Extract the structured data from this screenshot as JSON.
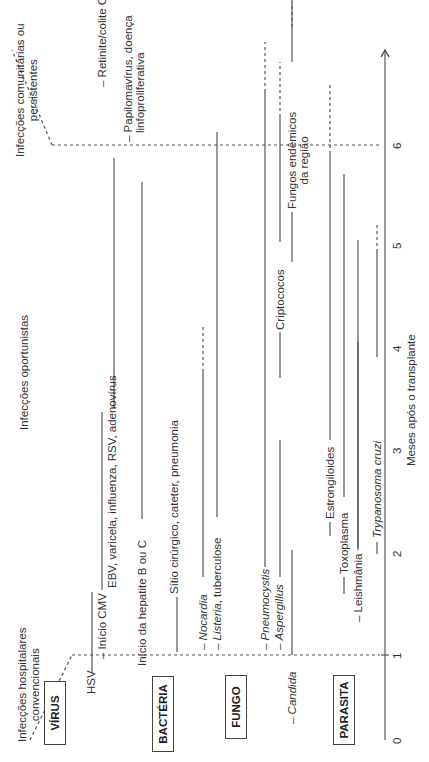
{
  "phases": {
    "early": "Infecções hospitalares convencionais",
    "early_line2": "convencionais",
    "early_line1": "Infecções hospitalares",
    "mid": "Infecções oportunistas",
    "late_line1": "Infecções comunitárias ou",
    "late_line2": "persistentes"
  },
  "categories": {
    "virus": "VÍRUS",
    "bacteria": "BACTÉRIA",
    "fungus": "FUNGO",
    "parasite": "PARASITA"
  },
  "labels": {
    "hsv": "HSV",
    "cmv_onset": "– Início CMV",
    "ebv": "EBV, varicela, influenza, RSV, adenovírus",
    "retinitis": "– Retinite/colite CMV",
    "hep_onset": "Início da hepatite B ou C",
    "papilloma_1": "– Papilomavírus, doença",
    "papilloma_2": "linfoproliferativa",
    "surgical": "Sítio cirúrgico, cateter, pneumonia",
    "nocardia": "Nocardia",
    "listeria": "Listeria",
    "listeria_rest": ", tuberculose",
    "pneumocystis": "Pneumocystis",
    "aspergillus": "Aspergillus",
    "candida": "Candida",
    "cryptococcus": "Criptococos",
    "endemic_1": "Fungos endêmicos",
    "endemic_2": "da região",
    "strongyloides": "Estrongiloides",
    "toxoplasma": "Toxoplasma",
    "leishmania": "– Leishmânia",
    "trypanosoma": "Trypanosoma cruzi",
    "dash": "– "
  },
  "axis": {
    "ticks": [
      "0",
      "1",
      "2",
      "3",
      "4",
      "5",
      "6"
    ],
    "label": "Meses após o transplante"
  },
  "timeline": {
    "unit": "months",
    "range": [
      0,
      6
    ],
    "bars": [
      {
        "name": "HSV",
        "start": 0.7,
        "end": 1.5
      },
      {
        "name": "Início CMV",
        "start": 1.6,
        "end": 3.4
      },
      {
        "name": "EBV, varicela, influenza, RSV, adenovírus",
        "start": 3.5,
        "end": 5.8
      },
      {
        "name": "Retinite/colite CMV",
        "start": 6.2,
        "end": 6.8
      },
      {
        "name": "Início da hepatite B ou C",
        "start": 2.3,
        "end": 5.7
      },
      {
        "name": "Papilomavírus, doença linfoproliferativa",
        "start": 7.0,
        "end": 7.4
      },
      {
        "name": "Sítio cirúrgico",
        "start": 0.7,
        "end": 1.3
      },
      {
        "name": "Nocardia",
        "start": 1.7,
        "end": 3.7,
        "dashed_to": 4.5
      },
      {
        "name": "Listeria, tuberculose",
        "start": 2.3,
        "end": 6.0
      },
      {
        "name": "Pneumocystis",
        "start": 1.9,
        "end": 6.0,
        "dashed_to": 6.8
      },
      {
        "name": "Aspergillus",
        "start": 1.8,
        "end": 3.2
      },
      {
        "name": "Candida",
        "start": 1.0,
        "end": 2.3
      },
      {
        "name": "Criptococos",
        "start": 3.6,
        "end": 3.9
      },
      {
        "name": "Fungos endêmicos",
        "start": 4.6,
        "end": 6.7,
        "dashed_to": 7.3
      },
      {
        "name": "Estrongiloides",
        "start": 2.8,
        "end": 5.9,
        "dashed_to": 6.8
      },
      {
        "name": "Toxoplasma",
        "start": 2.5,
        "end": 5.9
      },
      {
        "name": "Leishmânia",
        "start": 1.9,
        "end": 4.8
      },
      {
        "name": "Trypanosoma cruzi",
        "start": 3.6,
        "end": 4.9,
        "dashed_to": 5.2
      }
    ]
  }
}
